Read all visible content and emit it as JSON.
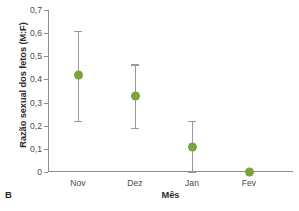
{
  "panel": {
    "label": "B"
  },
  "chart_data": {
    "type": "scatter",
    "title": "",
    "subtitle": "",
    "xlabel": "Mês",
    "ylabel": "Razão sexual dos fetos (M:F)",
    "categories": [
      "Nov",
      "Dez",
      "Jan",
      "Fev"
    ],
    "values": [
      0.42,
      0.33,
      0.11,
      0.0
    ],
    "error_low": [
      0.22,
      0.19,
      0.0,
      0.0
    ],
    "error_high": [
      0.61,
      0.465,
      0.22,
      0.0
    ],
    "ylim": [
      0,
      0.7
    ],
    "yticks": [
      0,
      0.1,
      0.2,
      0.3,
      0.4,
      0.5,
      0.6,
      0.7
    ],
    "ytick_labels": [
      "0",
      "0,1",
      "0,2",
      "0,3",
      "0,4",
      "0,5",
      "0,6",
      "0,7"
    ],
    "grid": false,
    "legend": false,
    "marker_color": "#7da33c",
    "errorbar_color": "#9a9a9a",
    "axis_color": "#8d8d8d",
    "series": [
      {
        "name": "Razão sexual dos fetos",
        "values": [
          0.42,
          0.33,
          0.11,
          0.0
        ]
      }
    ]
  }
}
